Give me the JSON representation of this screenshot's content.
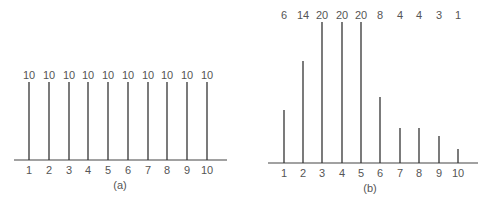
{
  "chart_data": [
    {
      "type": "bar",
      "title": "",
      "caption": "(a)",
      "xlabel": "",
      "ylabel": "",
      "grid": false,
      "categories": [
        "1",
        "2",
        "3",
        "4",
        "5",
        "6",
        "7",
        "8",
        "9",
        "10"
      ],
      "values": [
        10,
        10,
        10,
        10,
        10,
        10,
        10,
        10,
        10,
        10
      ],
      "value_labels": [
        "10",
        "10",
        "10",
        "10",
        "10",
        "10",
        "10",
        "10",
        "10",
        "10"
      ],
      "style": "stem/line bars with value labels above",
      "layout": {
        "axis_y": 160,
        "axis_x0": 14,
        "axis_x1": 227,
        "bar_x": [
          29,
          49,
          69,
          88,
          108,
          128,
          148,
          167,
          187,
          207
        ],
        "bar_top_y": [
          82,
          82,
          82,
          82,
          82,
          82,
          82,
          82,
          82,
          82
        ],
        "value_label_y": 79,
        "tick_label_y": 174,
        "caption_x": 120,
        "caption_y": 189
      }
    },
    {
      "type": "bar",
      "title": "",
      "caption": "(b)",
      "xlabel": "",
      "ylabel": "",
      "grid": false,
      "categories": [
        "1",
        "2",
        "3",
        "4",
        "5",
        "6",
        "7",
        "8",
        "9",
        "10"
      ],
      "values": [
        6,
        14,
        20,
        20,
        20,
        8,
        4,
        4,
        3,
        1
      ],
      "value_labels": [
        "6",
        "14",
        "20",
        "20",
        "20",
        "8",
        "4",
        "4",
        "3",
        "1"
      ],
      "style": "stem/line bars with value labels in a row at top",
      "layout": {
        "axis_y": 163,
        "axis_x0": 268,
        "axis_x1": 478,
        "bar_x": [
          284,
          303,
          322,
          342,
          361,
          380,
          400,
          419,
          439,
          458
        ],
        "bar_top_y": [
          110,
          61,
          22,
          22,
          22,
          97,
          128,
          128,
          136,
          149
        ],
        "value_label_y": 19,
        "tick_label_y": 177,
        "caption_x": 370,
        "caption_y": 192
      }
    }
  ]
}
